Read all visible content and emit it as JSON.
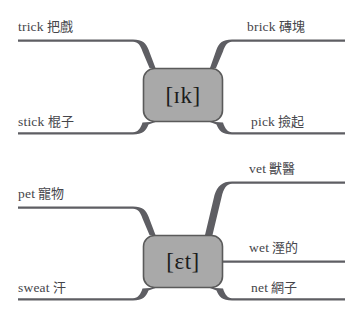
{
  "diagram": {
    "type": "rime-branching-chart",
    "colors": {
      "box_fill": "#a9a9a9",
      "box_stroke": "#5a5a5a",
      "line": "#5e5e63",
      "text": "#45454a",
      "rime_text": "#1c1c1c",
      "background": "#ffffff"
    },
    "groups": [
      {
        "id": "group-ik",
        "rime": "[ɪk]",
        "branches": [
          {
            "id": "trick",
            "word": "trick",
            "gloss": "把戲",
            "side": "left",
            "position": "top"
          },
          {
            "id": "stick",
            "word": "stick",
            "gloss": "棍子",
            "side": "left",
            "position": "bottom"
          },
          {
            "id": "brick",
            "word": "brick",
            "gloss": "磚塊",
            "side": "right",
            "position": "top"
          },
          {
            "id": "pick",
            "word": "pick",
            "gloss": "撿起",
            "side": "right",
            "position": "bottom"
          }
        ]
      },
      {
        "id": "group-et",
        "rime": "[ɛt]",
        "branches": [
          {
            "id": "pet",
            "word": "pet",
            "gloss": "寵物",
            "side": "left",
            "position": "top"
          },
          {
            "id": "sweat",
            "word": "sweat",
            "gloss": "汗",
            "side": "left",
            "position": "bottom"
          },
          {
            "id": "vet",
            "word": "vet",
            "gloss": "獸醫",
            "side": "right",
            "position": "top"
          },
          {
            "id": "wet",
            "word": "wet",
            "gloss": "溼的",
            "side": "right",
            "position": "middle"
          },
          {
            "id": "net",
            "word": "net",
            "gloss": "網子",
            "side": "right",
            "position": "bottom"
          }
        ]
      }
    ]
  }
}
